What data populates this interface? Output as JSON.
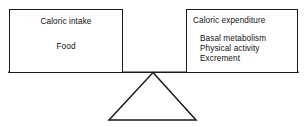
{
  "diagram": {
    "type": "balance-scale",
    "left_pan": {
      "heading": "Caloric intake",
      "items": [
        "Food"
      ]
    },
    "right_pan": {
      "heading": "Caloric expenditure",
      "items": [
        "Basal metabolism",
        "Physical activity",
        "Excrement"
      ]
    },
    "fulcrum": {
      "shape": "triangle",
      "label": ""
    },
    "colors": {
      "stroke": "#1a1a1a",
      "background": "#ffffff",
      "text": "#111111"
    }
  }
}
